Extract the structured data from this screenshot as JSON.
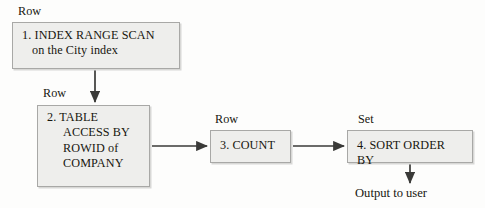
{
  "diagram": {
    "type": "flowchart",
    "background_color": "#fdfdfc",
    "box_fill_color": "#eeeeec",
    "box_border_color": "#a8a8a6",
    "text_color": "#17160f",
    "connector_color": "#3a3a38"
  },
  "nodes": [
    {
      "id": "node-1",
      "step": "1.",
      "line1": "1. INDEX RANGE SCAN",
      "line2": "on the City index",
      "row_label": "Row"
    },
    {
      "id": "node-2",
      "step": "2.",
      "line1": "2. TABLE",
      "line2": "ACCESS BY",
      "line3": "ROWID of",
      "line4": "COMPANY",
      "row_label": "Row"
    },
    {
      "id": "node-3",
      "step": "3.",
      "line1": "3. COUNT",
      "row_label": "Row"
    },
    {
      "id": "node-4",
      "step": "4.",
      "line1": "4. SORT ORDER BY",
      "row_label": "Set"
    }
  ],
  "captions": {
    "row_1": "Row",
    "row_2": "Row",
    "row_3": "Row",
    "set_4": "Set",
    "output": "Output to user"
  },
  "connectors": [
    {
      "name": "node-1-to-node-2",
      "direction": "down",
      "from": "node-1",
      "to": "node-2"
    },
    {
      "name": "node-2-to-node-3",
      "direction": "right",
      "from": "node-2",
      "to": "node-3"
    },
    {
      "name": "node-3-to-node-4",
      "direction": "right",
      "from": "node-3",
      "to": "node-4"
    },
    {
      "name": "node-4-to-output",
      "direction": "down",
      "from": "node-4",
      "to": "output"
    }
  ]
}
